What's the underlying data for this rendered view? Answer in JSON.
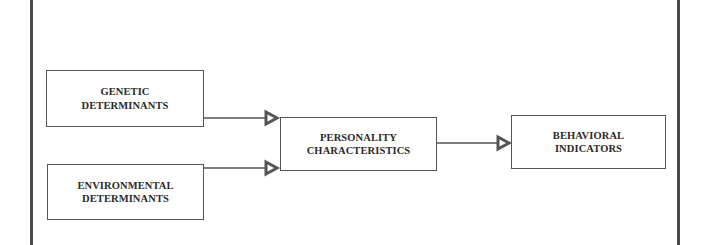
{
  "diagram": {
    "type": "flow",
    "nodes": [
      {
        "id": "genetic",
        "label": "GENETIC\nDETERMINANTS"
      },
      {
        "id": "environmental",
        "label": "ENVIRONMENTAL\nDETERMINANTS"
      },
      {
        "id": "personality",
        "label": "PERSONALITY\nCHARACTERISTICS"
      },
      {
        "id": "behavioral",
        "label": "BEHAVIORAL\nINDICATORS"
      }
    ],
    "edges": [
      {
        "from": "genetic",
        "to": "personality",
        "arrowhead": "hollow-triangle"
      },
      {
        "from": "environmental",
        "to": "personality",
        "arrowhead": "hollow-triangle"
      },
      {
        "from": "personality",
        "to": "behavioral",
        "arrowhead": "hollow-triangle"
      }
    ],
    "colors": {
      "stroke": "#555555",
      "text": "#2a2a2a",
      "frame": "#4a4a4a",
      "background": "#ffffff"
    }
  }
}
